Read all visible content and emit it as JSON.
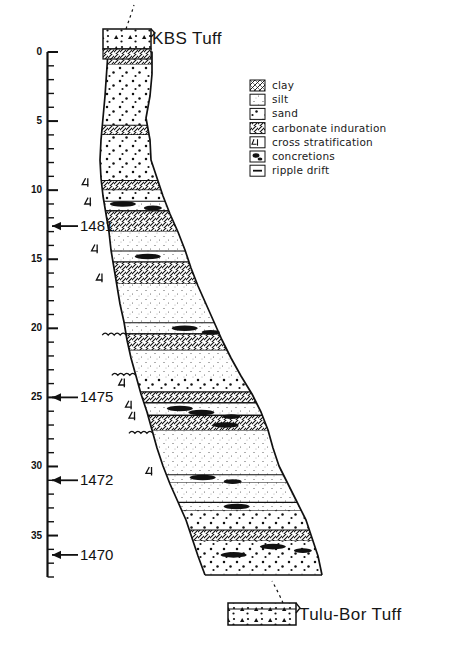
{
  "figure": {
    "type": "stratigraphic-column",
    "title_top": "KBS Tuff",
    "title_bottom": "Tulu-Bor Tuff"
  },
  "axis": {
    "unit_label": "",
    "min": 0,
    "max": 38,
    "major_interval": 5,
    "minor_interval": 1,
    "ticks": [
      {
        "value": 0,
        "label": "0"
      },
      {
        "value": 5,
        "label": "5"
      },
      {
        "value": 10,
        "label": "10"
      },
      {
        "value": 15,
        "label": "15"
      },
      {
        "value": 20,
        "label": "20"
      },
      {
        "value": 25,
        "label": "25"
      },
      {
        "value": 30,
        "label": "30"
      },
      {
        "value": 35,
        "label": "35"
      }
    ]
  },
  "markers": [
    {
      "label": "1481",
      "depth": 12.6
    },
    {
      "label": "1475",
      "depth": 25.0
    },
    {
      "label": "1472",
      "depth": 31.0
    },
    {
      "label": "1470",
      "depth": 36.4
    }
  ],
  "legend": {
    "items": [
      {
        "label": "clay",
        "pattern": "clay"
      },
      {
        "label": "silt",
        "pattern": "silt"
      },
      {
        "label": "sand",
        "pattern": "sand"
      },
      {
        "label": "carbonate induration",
        "pattern": "carbonate"
      },
      {
        "label": "cross stratification",
        "pattern": "cross-strat"
      },
      {
        "label": "concretions",
        "pattern": "concretions"
      },
      {
        "label": "ripple drift",
        "pattern": "ripple-drift"
      }
    ]
  },
  "chart_data": {
    "type": "column",
    "ylabel": "",
    "ylim": [
      0,
      38
    ],
    "beds": [
      {
        "top": 0.0,
        "base": 0.9,
        "lithology": "carbonate"
      },
      {
        "top": 0.9,
        "base": 5.3,
        "lithology": "sand"
      },
      {
        "top": 5.3,
        "base": 6.0,
        "lithology": "carbonate"
      },
      {
        "top": 6.0,
        "base": 9.3,
        "lithology": "sand"
      },
      {
        "top": 9.3,
        "base": 10.0,
        "lithology": "carbonate"
      },
      {
        "top": 10.0,
        "base": 10.8,
        "lithology": "sand"
      },
      {
        "top": 10.8,
        "base": 11.5,
        "lithology": "concretions"
      },
      {
        "top": 11.5,
        "base": 13.0,
        "lithology": "carbonate"
      },
      {
        "top": 13.0,
        "base": 14.4,
        "lithology": "silt"
      },
      {
        "top": 14.4,
        "base": 15.2,
        "lithology": "concretions"
      },
      {
        "top": 15.2,
        "base": 16.8,
        "lithology": "carbonate"
      },
      {
        "top": 16.8,
        "base": 19.6,
        "lithology": "silt"
      },
      {
        "top": 19.6,
        "base": 20.4,
        "lithology": "concretions"
      },
      {
        "top": 20.4,
        "base": 21.6,
        "lithology": "carbonate"
      },
      {
        "top": 21.6,
        "base": 23.6,
        "lithology": "silt"
      },
      {
        "top": 23.6,
        "base": 24.6,
        "lithology": "sand"
      },
      {
        "top": 24.6,
        "base": 25.4,
        "lithology": "carbonate"
      },
      {
        "top": 25.4,
        "base": 26.3,
        "lithology": "concretions"
      },
      {
        "top": 26.3,
        "base": 27.4,
        "lithology": "carbonate"
      },
      {
        "top": 27.4,
        "base": 28.6,
        "lithology": "ripple-drift"
      },
      {
        "top": 28.6,
        "base": 30.6,
        "lithology": "silt"
      },
      {
        "top": 30.6,
        "base": 31.2,
        "lithology": "concretions"
      },
      {
        "top": 31.2,
        "base": 32.6,
        "lithology": "silt"
      },
      {
        "top": 32.6,
        "base": 33.2,
        "lithology": "concretions"
      },
      {
        "top": 33.2,
        "base": 34.6,
        "lithology": "sand"
      },
      {
        "top": 34.6,
        "base": 35.4,
        "lithology": "carbonate"
      },
      {
        "top": 35.4,
        "base": 37.8,
        "lithology": "sand"
      }
    ],
    "cross_stratification_depths": [
      9.5,
      10.9,
      14.3,
      16.4,
      24.0,
      25.6,
      26.4,
      30.4
    ],
    "ripple_drift_depths": [
      20.5,
      23.4,
      27.6
    ],
    "concretion_depths": [
      11.0,
      14.8,
      20.0,
      25.8,
      26.1,
      27.0,
      30.8,
      32.9,
      35.8,
      36.4
    ]
  }
}
